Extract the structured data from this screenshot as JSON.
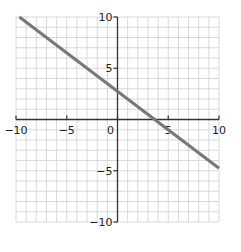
{
  "chart_data": {
    "type": "line",
    "title": "",
    "xlabel": "",
    "ylabel": "",
    "xlim": [
      -10,
      10
    ],
    "ylim": [
      -10,
      10
    ],
    "grid": true,
    "grid_step": 1,
    "x_ticks": [
      -10,
      -5,
      0,
      5,
      10
    ],
    "y_ticks": [
      -10,
      -5,
      5,
      10
    ],
    "x_tick_labels": [
      "−10",
      "−5",
      "0",
      "5",
      "10"
    ],
    "y_tick_labels": [
      "−10",
      "−5",
      "5",
      "10"
    ],
    "series": [
      {
        "name": "line",
        "x": [
          -10,
          10
        ],
        "y": [
          10.25,
          -4.75
        ],
        "color": "#777777"
      }
    ],
    "equation_estimate": "y = -0.75x + 2.75"
  },
  "colors": {
    "grid": "#cfcfcf",
    "axis": "#333333",
    "line": "#777777"
  }
}
